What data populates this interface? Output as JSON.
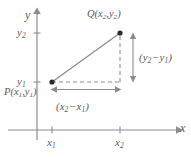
{
  "figure": {
    "axes": {
      "x_label": "x",
      "y_label": "y",
      "x_ticks": [
        {
          "label": "x",
          "sub": "1"
        },
        {
          "label": "x",
          "sub": "2"
        }
      ],
      "y_ticks": [
        {
          "label": "y",
          "sub": "2"
        },
        {
          "label": "y",
          "sub": "1"
        }
      ]
    },
    "points": [
      {
        "name": "P",
        "label_main": "P(x",
        "label_sub1": "1",
        "label_mid": ",y",
        "label_sub2": "1",
        "label_end": ")"
      },
      {
        "name": "Q",
        "label_main": "Q(x",
        "label_sub1": "2",
        "label_mid": ",y",
        "label_sub2": "2",
        "label_end": ")"
      }
    ],
    "measurements": {
      "horizontal": {
        "open": "(x",
        "sub1": "2",
        "minus": "−",
        "var2": "x",
        "sub2": "1",
        "close": ")"
      },
      "vertical": {
        "open": "(y",
        "sub1": "2",
        "minus": "−",
        "var2": "y",
        "sub2": "1",
        "close": ")"
      }
    },
    "colors": {
      "line": "#8c8c8c",
      "text": "#5a5a5a",
      "point": "#2b2b2b",
      "background": "#ffffff"
    }
  }
}
